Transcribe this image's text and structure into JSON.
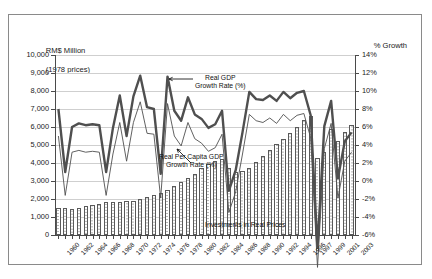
{
  "figure": {
    "left_axis_title_line1": "RM$ Million",
    "left_axis_title_line2": "(1978 prices)",
    "right_axis_title": "% Growth"
  },
  "annotations": {
    "gdp_line1": "Real GDP",
    "gdp_line2": "Growth Rate (%)",
    "percapita_line1": "Real Per Capita GDP",
    "percapita_line2": "Growth Rate (%)",
    "investments": "Investments in Real Prices"
  },
  "chart_data": {
    "type": "bar",
    "title": "",
    "xlabel": "",
    "ylabel": "RM$ Million (1978 prices)",
    "y2label": "% Growth",
    "ylim": [
      0,
      10000
    ],
    "y2lim": [
      -6,
      14
    ],
    "grid": true,
    "legend": "annotations",
    "y_ticks": [
      "0",
      "1,000",
      "2,000",
      "3,000",
      "4,000",
      "5,000",
      "6,000",
      "7,000",
      "8,000",
      "9,000",
      "10,000"
    ],
    "y2_ticks": [
      "-6%",
      "-4%",
      "-2%",
      "0%",
      "2%",
      "4%",
      "6%",
      "8%",
      "10%",
      "12%",
      "14%"
    ],
    "x": [
      1960,
      1961,
      1962,
      1963,
      1964,
      1965,
      1966,
      1967,
      1968,
      1969,
      1970,
      1971,
      1972,
      1973,
      1974,
      1975,
      1976,
      1977,
      1978,
      1979,
      1980,
      1981,
      1982,
      1983,
      1984,
      1985,
      1986,
      1987,
      1988,
      1989,
      1990,
      1991,
      1992,
      1993,
      1994,
      1995,
      1996,
      1997,
      1998,
      1999,
      2000,
      2001,
      2002,
      2003
    ],
    "x_tick_labels": [
      "1960",
      "1962",
      "1964",
      "1966",
      "1968",
      "1970",
      "1972",
      "1974",
      "1976",
      "1978",
      "1980",
      "1982",
      "1984",
      "1986",
      "1988",
      "1990",
      "1992",
      "1994",
      "1996",
      "1997",
      "1999",
      "2001",
      "2003"
    ],
    "series": [
      {
        "name": "Investments in Real Prices",
        "type": "bar",
        "axis": "left",
        "unit": "RM$ Million (1978 prices)",
        "values": [
          1500,
          1480,
          1470,
          1520,
          1600,
          1650,
          1700,
          1820,
          1830,
          1810,
          1870,
          1900,
          2000,
          2100,
          2250,
          2350,
          2500,
          2700,
          2950,
          3150,
          3400,
          3700,
          3950,
          4100,
          4200,
          3750,
          3500,
          3550,
          3700,
          4050,
          4400,
          4750,
          5050,
          5350,
          5650,
          6000,
          6400,
          6600,
          4300,
          4600,
          5900,
          5200,
          5700,
          6100
        ]
      },
      {
        "name": "Real GDP Growth Rate (%)",
        "type": "line",
        "axis": "right",
        "unit": "%",
        "values": [
          8.0,
          1.0,
          6.0,
          6.4,
          6.2,
          6.3,
          6.2,
          1.0,
          5.9,
          9.5,
          5.0,
          9.4,
          11.7,
          8.2,
          8.0,
          0.8,
          11.6,
          7.8,
          6.7,
          9.3,
          7.4,
          6.9,
          5.9,
          6.3,
          7.8,
          -1.1,
          1.2,
          5.4,
          9.9,
          9.1,
          9.0,
          9.5,
          8.9,
          9.9,
          9.2,
          9.8,
          10.0,
          7.3,
          -7.4,
          6.1,
          8.9,
          0.3,
          4.4,
          5.4
        ]
      },
      {
        "name": "Real Per Capita GDP Growth Rate (%)",
        "type": "line",
        "axis": "right",
        "unit": "%",
        "values": [
          5.0,
          -1.6,
          3.2,
          3.4,
          3.2,
          3.3,
          3.2,
          -1.6,
          3.0,
          6.5,
          2.2,
          6.5,
          8.8,
          5.3,
          5.2,
          -1.9,
          8.6,
          5.0,
          3.9,
          6.5,
          4.7,
          4.2,
          3.3,
          3.7,
          5.2,
          -3.5,
          -1.2,
          3.0,
          7.4,
          6.7,
          6.5,
          7.0,
          6.4,
          7.4,
          6.7,
          7.3,
          7.5,
          4.8,
          -9.6,
          3.6,
          6.4,
          -1.9,
          2.2,
          3.2
        ]
      }
    ]
  }
}
